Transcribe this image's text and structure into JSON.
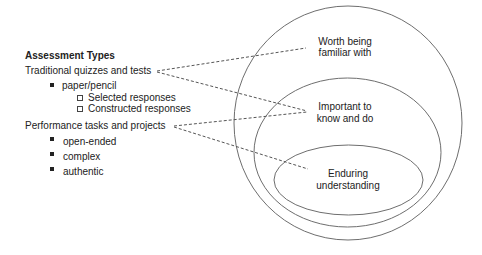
{
  "left_panel": {
    "title": "Assessment Types",
    "groups": [
      {
        "label": "Traditional quizzes and tests",
        "items": [
          {
            "label": "paper/pencil",
            "subitems": [
              "Selected responses",
              "Constructed responses"
            ]
          }
        ]
      },
      {
        "label": "Performance tasks and projects",
        "items": [
          {
            "label": "open-ended"
          },
          {
            "label": "complex"
          },
          {
            "label": "authentic"
          }
        ]
      }
    ]
  },
  "diagram": {
    "rings": [
      {
        "label_line1": "Worth being",
        "label_line2": "familiar with"
      },
      {
        "label_line1": "Important to",
        "label_line2": "know and do"
      },
      {
        "label_line1": "Enduring",
        "label_line2": "understanding"
      }
    ],
    "colors": {
      "stroke": "#6e6e6e",
      "text": "#222222"
    }
  }
}
